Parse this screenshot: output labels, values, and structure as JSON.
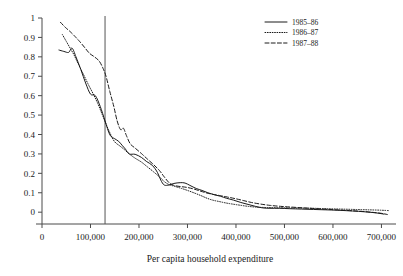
{
  "chart_data": {
    "type": "line",
    "title": "",
    "xlabel": "Per capita household expenditure",
    "ylabel": "",
    "xlim": [
      0,
      730000
    ],
    "ylim": [
      -0.03,
      1.0
    ],
    "grid": false,
    "legend_position": "top-right",
    "x_ticks": [
      "0",
      "100,000",
      "200,000",
      "300,000",
      "400,000",
      "500,000",
      "600,000",
      "700,000"
    ],
    "x_tick_values": [
      0,
      100000,
      200000,
      300000,
      400000,
      500000,
      600000,
      700000
    ],
    "y_ticks": [
      "0",
      "0.1",
      "0.2",
      "0.3",
      "0.4",
      "0.5",
      "0.6",
      "0.7",
      "0.8",
      "0.9",
      "1"
    ],
    "y_tick_values": [
      0,
      0.1,
      0.2,
      0.3,
      0.4,
      0.5,
      0.6,
      0.7,
      0.8,
      0.9,
      1
    ],
    "annotations": [
      {
        "name": "poverty-line",
        "type": "vline",
        "x": 130000
      }
    ],
    "series": [
      {
        "name": "1985-86",
        "label": "1985–86",
        "style": "solid",
        "points": [
          [
            35000,
            0.835
          ],
          [
            45000,
            0.828
          ],
          [
            55000,
            0.823
          ],
          [
            62000,
            0.845
          ],
          [
            70000,
            0.8
          ],
          [
            80000,
            0.735
          ],
          [
            90000,
            0.665
          ],
          [
            100000,
            0.608
          ],
          [
            110000,
            0.6
          ],
          [
            120000,
            0.545
          ],
          [
            130000,
            0.47
          ],
          [
            140000,
            0.398
          ],
          [
            150000,
            0.378
          ],
          [
            158000,
            0.365
          ],
          [
            165000,
            0.345
          ],
          [
            172000,
            0.325
          ],
          [
            180000,
            0.3
          ],
          [
            192000,
            0.298
          ],
          [
            205000,
            0.282
          ],
          [
            215000,
            0.262
          ],
          [
            228000,
            0.24
          ],
          [
            238000,
            0.205
          ],
          [
            245000,
            0.165
          ],
          [
            252000,
            0.14
          ],
          [
            262000,
            0.14
          ],
          [
            272000,
            0.148
          ],
          [
            285000,
            0.152
          ],
          [
            295000,
            0.15
          ],
          [
            305000,
            0.138
          ],
          [
            318000,
            0.122
          ],
          [
            330000,
            0.112
          ],
          [
            342000,
            0.1
          ],
          [
            355000,
            0.09
          ],
          [
            368000,
            0.082
          ],
          [
            380000,
            0.072
          ],
          [
            395000,
            0.062
          ],
          [
            410000,
            0.05
          ],
          [
            425000,
            0.04
          ],
          [
            440000,
            0.03
          ],
          [
            455000,
            0.022
          ],
          [
            470000,
            0.02
          ],
          [
            490000,
            0.02
          ],
          [
            510000,
            0.018
          ],
          [
            535000,
            0.016
          ],
          [
            560000,
            0.014
          ],
          [
            585000,
            0.012
          ],
          [
            610000,
            0.01
          ],
          [
            640000,
            0.006
          ],
          [
            665000,
            0.002
          ],
          [
            690000,
            -0.004
          ],
          [
            705000,
            -0.01
          ]
        ]
      },
      {
        "name": "1986-87",
        "label": "1986–87",
        "style": "dotted",
        "points": [
          [
            42000,
            0.915
          ],
          [
            50000,
            0.88
          ],
          [
            58000,
            0.845
          ],
          [
            66000,
            0.81
          ],
          [
            75000,
            0.762
          ],
          [
            85000,
            0.712
          ],
          [
            95000,
            0.66
          ],
          [
            105000,
            0.612
          ],
          [
            115000,
            0.56
          ],
          [
            125000,
            0.498
          ],
          [
            133000,
            0.448
          ],
          [
            142000,
            0.398
          ],
          [
            150000,
            0.362
          ],
          [
            160000,
            0.342
          ],
          [
            170000,
            0.322
          ],
          [
            180000,
            0.3
          ],
          [
            192000,
            0.278
          ],
          [
            205000,
            0.258
          ],
          [
            218000,
            0.232
          ],
          [
            230000,
            0.208
          ],
          [
            242000,
            0.182
          ],
          [
            252000,
            0.158
          ],
          [
            262000,
            0.142
          ],
          [
            275000,
            0.132
          ],
          [
            288000,
            0.122
          ],
          [
            300000,
            0.112
          ],
          [
            315000,
            0.098
          ],
          [
            328000,
            0.085
          ],
          [
            340000,
            0.072
          ],
          [
            352000,
            0.062
          ],
          [
            365000,
            0.055
          ],
          [
            378000,
            0.048
          ],
          [
            392000,
            0.042
          ],
          [
            408000,
            0.036
          ],
          [
            425000,
            0.03
          ],
          [
            442000,
            0.026
          ],
          [
            462000,
            0.024
          ],
          [
            485000,
            0.023
          ],
          [
            510000,
            0.022
          ],
          [
            535000,
            0.021
          ],
          [
            560000,
            0.02
          ],
          [
            585000,
            0.018
          ],
          [
            615000,
            0.016
          ],
          [
            645000,
            0.014
          ],
          [
            675000,
            0.012
          ],
          [
            700000,
            0.01
          ],
          [
            715000,
            0.008
          ]
        ]
      },
      {
        "name": "1987-88",
        "label": "1987–88",
        "style": "dashed",
        "points": [
          [
            38000,
            0.978
          ],
          [
            48000,
            0.952
          ],
          [
            58000,
            0.93
          ],
          [
            68000,
            0.905
          ],
          [
            78000,
            0.878
          ],
          [
            88000,
            0.848
          ],
          [
            98000,
            0.818
          ],
          [
            108000,
            0.8
          ],
          [
            118000,
            0.778
          ],
          [
            126000,
            0.74
          ],
          [
            132000,
            0.7
          ],
          [
            140000,
            0.62
          ],
          [
            148000,
            0.545
          ],
          [
            155000,
            0.47
          ],
          [
            162000,
            0.425
          ],
          [
            168000,
            0.432
          ],
          [
            174000,
            0.395
          ],
          [
            182000,
            0.352
          ],
          [
            192000,
            0.33
          ],
          [
            205000,
            0.302
          ],
          [
            218000,
            0.272
          ],
          [
            230000,
            0.245
          ],
          [
            242000,
            0.215
          ],
          [
            252000,
            0.182
          ],
          [
            262000,
            0.152
          ],
          [
            272000,
            0.138
          ],
          [
            285000,
            0.132
          ],
          [
            298000,
            0.128
          ],
          [
            312000,
            0.12
          ],
          [
            325000,
            0.11
          ],
          [
            338000,
            0.1
          ],
          [
            352000,
            0.092
          ],
          [
            368000,
            0.085
          ],
          [
            382000,
            0.078
          ],
          [
            398000,
            0.07
          ],
          [
            415000,
            0.06
          ],
          [
            432000,
            0.05
          ],
          [
            450000,
            0.042
          ],
          [
            470000,
            0.035
          ],
          [
            492000,
            0.03
          ],
          [
            515000,
            0.026
          ],
          [
            540000,
            0.022
          ],
          [
            565000,
            0.018
          ],
          [
            592000,
            0.014
          ],
          [
            620000,
            0.01
          ],
          [
            650000,
            0.006
          ],
          [
            678000,
            0.0
          ],
          [
            700000,
            -0.006
          ],
          [
            712000,
            -0.012
          ]
        ]
      }
    ]
  }
}
